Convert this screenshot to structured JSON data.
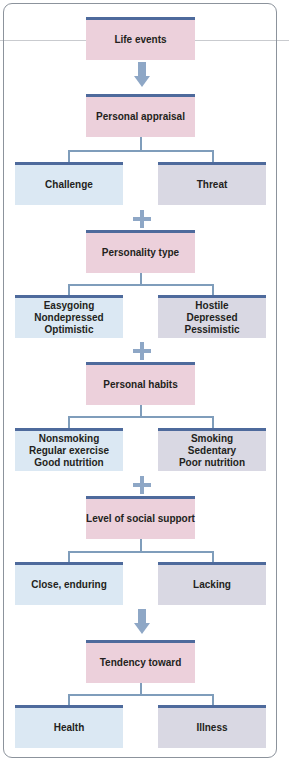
{
  "diagram": {
    "nodes": {
      "life_events": "Life events",
      "personal_appraisal": "Personal appraisal",
      "challenge": "Challenge",
      "threat": "Threat",
      "personality_type": "Personality type",
      "personality_positive": "Easygoing\nNondepressed\nOptimistic",
      "personality_negative": "Hostile\nDepressed\nPessimistic",
      "personal_habits": "Personal habits",
      "habits_positive": "Nonsmoking\nRegular exercise\nGood nutrition",
      "habits_negative": "Smoking\nSedentary\nPoor nutrition",
      "social_support": "Level of social support",
      "support_positive": "Close, enduring",
      "support_negative": "Lacking",
      "tendency_toward": "Tendency toward",
      "health": "Health",
      "illness": "Illness"
    },
    "connectors": {
      "arrow_icon": "down-arrow",
      "plus_icon": "plus"
    },
    "colors": {
      "factor_box": "#ecd0db",
      "positive_box": "#dbe8f3",
      "negative_box": "#d9d8e3",
      "box_top_bar": "#4e6a9c",
      "connector": "#8ea7c6",
      "frame_border": "#8c939c"
    }
  }
}
